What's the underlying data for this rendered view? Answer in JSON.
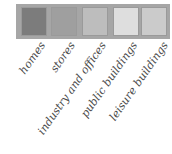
{
  "legend": {
    "items": [
      {
        "label": "homes",
        "color": "#7c7c7c"
      },
      {
        "label": "stores",
        "color": "#9f9f9f"
      },
      {
        "label": "industry and offices",
        "color": "#bdbdbd"
      },
      {
        "label": "public buildings",
        "color": "#dedede"
      },
      {
        "label": "leisure buildings",
        "color": "#cbcbcb"
      }
    ],
    "frame_color": "#a6a6a6"
  }
}
